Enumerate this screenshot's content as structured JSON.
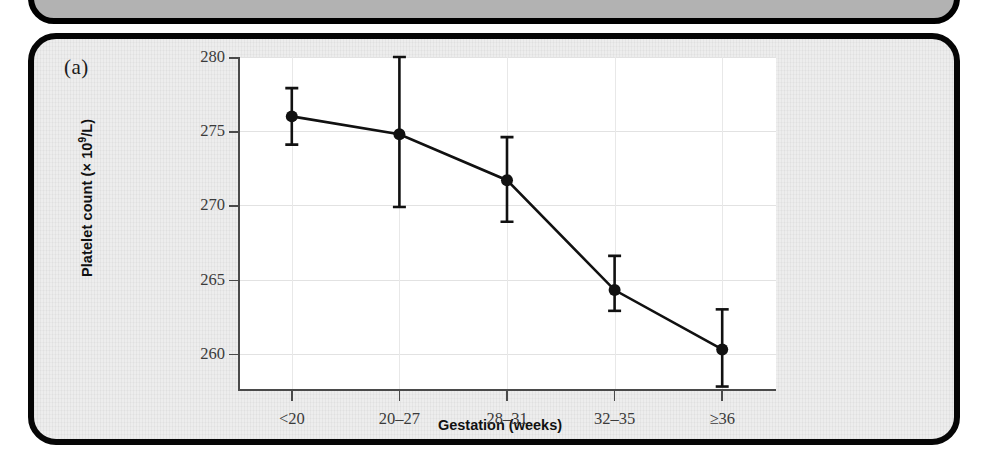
{
  "figure": {
    "panel_letter": "(a)",
    "background_color": "#ededed",
    "border_color": "#060606",
    "plot_area_color": "#ffffff",
    "top_panel_color": "#b2b2b2"
  },
  "chart_data": {
    "type": "line",
    "title": "",
    "xlabel": "Gestation (weeks)",
    "ylabel": "Platelet count (× 10⁹/L)",
    "ylabel_text": "Platelet count (",
    "ylabel_mult": "× 10",
    "ylabel_exp": "9",
    "ylabel_tail": "/L)",
    "categories": [
      "<20",
      "20–27",
      "28–31",
      "32–35",
      "≥36"
    ],
    "values": [
      276.0,
      274.8,
      271.7,
      264.3,
      260.3
    ],
    "error_low": [
      274.1,
      269.9,
      268.9,
      262.9,
      257.8
    ],
    "error_high": [
      277.9,
      280.0,
      274.6,
      266.6,
      263.0
    ],
    "ylim": [
      257.5,
      280
    ],
    "yticks": [
      260,
      265,
      270,
      275,
      280
    ],
    "ytick_labels": [
      "260",
      "265",
      "270",
      "275",
      "280"
    ],
    "grid": true,
    "legend": false,
    "marker": "filled-circle",
    "marker_color": "#111111",
    "line_color": "#111111",
    "error_bar_color": "#111111"
  }
}
